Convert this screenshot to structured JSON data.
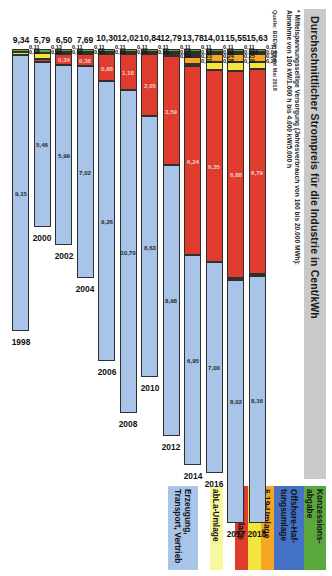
{
  "header": {
    "title": "Durchschnittlicher Strompreis für die Industrie in Cent/kWh",
    "footnote_line1": "* Mittelspannungsseitige Versorgung (Jahresverbrauch von 160 bis 20.000 MWh):",
    "footnote_line2": "Abnahme von 100 kW/1.600 h bis 4.000 kW/5.000 h",
    "source": "Quelle: BDEW, Stand Mai 2018"
  },
  "legend": {
    "items": [
      {
        "label": "Konzessions-abgabe",
        "color": "#5ba83f"
      },
      {
        "label": "Offshore-Haf-tungsumlage",
        "color": "#4472c4"
      },
      {
        "label": "§ 19-Umlage",
        "color": "#f5a623"
      },
      {
        "label": "KWKG",
        "color": "#f2e63d"
      },
      {
        "label": "EEG-Umlage",
        "color": "#e03c2d"
      },
      {
        "label": "abLa-Umlage",
        "color": "#f7f79e"
      },
      {
        "label": "Erzeugung, Transport, Vertrieb",
        "color": "#a8c4e8"
      }
    ]
  },
  "chart_data": {
    "type": "bar",
    "orientation": "horizontal-stacked",
    "title": "Durchschnittlicher Strompreis für die Industrie in Cent/kWh",
    "xlabel": "",
    "ylabel": "Cent/kWh",
    "xlim": [
      0,
      16
    ],
    "grid": false,
    "legend_position": "right",
    "categories": [
      "1998",
      "2000",
      "2002",
      "2004",
      "2006",
      "2008",
      "2010",
      "2012",
      "2014",
      "2016",
      "2017",
      "2018"
    ],
    "series": [
      {
        "name": "Konzessionsabgabe",
        "color": "#5ba83f",
        "values": [
          0.11,
          0.11,
          0.11,
          0.11,
          0.11,
          0.11,
          0.11,
          0.11,
          0.11,
          0.11,
          0.11,
          0.11
        ]
      },
      {
        "name": "Offshore-Haftungsumlage",
        "color": "#4472c4",
        "values": [
          null,
          null,
          null,
          null,
          null,
          null,
          null,
          null,
          0.07,
          0.03,
          0.006,
          0.04
        ]
      },
      {
        "name": "§ 19-Umlage",
        "color": "#f5a623",
        "values": [
          null,
          null,
          0.13,
          null,
          null,
          null,
          null,
          0.07,
          0.23,
          0.24,
          0.25,
          0.24
        ]
      },
      {
        "name": "KWKG",
        "color": "#f2e63d",
        "values": [
          0.08,
          0.08,
          0.2,
          0.05,
          0.05,
          0.05,
          0.05,
          0.04,
          0.17,
          0.28,
          0.29,
          0.26
        ]
      },
      {
        "name": "EEG-Umlage",
        "color": "#e03c2d",
        "values": [
          null,
          0.2,
          0.34,
          0.38,
          0.88,
          1.18,
          2.05,
          3.59,
          6.24,
          6.35,
          6.88,
          6.79
        ]
      },
      {
        "name": "Erzeugung, Transport, Vertrieb",
        "color": "#a8c4e8",
        "values": [
          9.15,
          5.46,
          5.99,
          7.02,
          9.26,
          10.7,
          8.63,
          8.98,
          6.95,
          7.0,
          8.02,
          8.16
        ]
      }
    ],
    "totals": [
      9.34,
      5.79,
      6.5,
      7.69,
      10.3,
      12.02,
      10.84,
      12.79,
      13.78,
      14.01,
      15.55,
      15.63
    ]
  },
  "rows": [
    {
      "year": "2018",
      "total": "15,63",
      "ticks": [
        "0,11",
        "0,04",
        "0,24",
        "0,26"
      ],
      "segs": [
        {
          "name": "konzessionsabgabe",
          "color": "#5ba83f",
          "w": 0.11,
          "label": ""
        },
        {
          "name": "offshore-haftungsumlage",
          "color": "#4472c4",
          "w": 0.04,
          "label": ""
        },
        {
          "name": "paragraph-19-umlage",
          "color": "#f5a623",
          "w": 0.24,
          "label": ""
        },
        {
          "name": "kwkg",
          "color": "#f2e63d",
          "w": 0.26,
          "label": ""
        },
        {
          "name": "eeg-umlage",
          "color": "#e03c2d",
          "w": 6.79,
          "label": "6,79"
        },
        {
          "name": "abla-umlage",
          "color": "#f7f79e",
          "w": 0.03,
          "label": ""
        },
        {
          "name": "erzeugung-transport-vertrieb",
          "color": "#a8c4e8",
          "w": 8.16,
          "label": "8,16"
        }
      ]
    },
    {
      "year": "2017",
      "total": "15,55",
      "ticks": [
        "0,11",
        "0,006",
        "0,25",
        "0,29"
      ],
      "segs": [
        {
          "name": "konzessionsabgabe",
          "color": "#5ba83f",
          "w": 0.11,
          "label": ""
        },
        {
          "name": "offshore-haftungsumlage",
          "color": "#4472c4",
          "w": 0.03,
          "label": ""
        },
        {
          "name": "paragraph-19-umlage",
          "color": "#f5a623",
          "w": 0.25,
          "label": ""
        },
        {
          "name": "kwkg",
          "color": "#f2e63d",
          "w": 0.29,
          "label": ""
        },
        {
          "name": "eeg-umlage",
          "color": "#e03c2d",
          "w": 6.88,
          "label": "6,88"
        },
        {
          "name": "abla-umlage",
          "color": "#f7f79e",
          "w": 0.03,
          "label": ""
        },
        {
          "name": "erzeugung-transport-vertrieb",
          "color": "#a8c4e8",
          "w": 8.02,
          "label": "8,02"
        }
      ]
    },
    {
      "year": "2016",
      "total": "14,01",
      "ticks": [
        "0,11",
        "0,03",
        "0,24",
        "0,28"
      ],
      "segs": [
        {
          "name": "konzessionsabgabe",
          "color": "#5ba83f",
          "w": 0.11,
          "label": ""
        },
        {
          "name": "offshore-haftungsumlage",
          "color": "#4472c4",
          "w": 0.03,
          "label": ""
        },
        {
          "name": "paragraph-19-umlage",
          "color": "#f5a623",
          "w": 0.24,
          "label": ""
        },
        {
          "name": "kwkg",
          "color": "#f2e63d",
          "w": 0.28,
          "label": ""
        },
        {
          "name": "eeg-umlage",
          "color": "#e03c2d",
          "w": 6.35,
          "label": "6,35"
        },
        {
          "name": "erzeugung-transport-vertrieb",
          "color": "#a8c4e8",
          "w": 7.0,
          "label": "7,00"
        }
      ]
    },
    {
      "year": "2014",
      "total": "13,78",
      "ticks": [
        "0,11",
        "0,17",
        "0,23",
        "0,07"
      ],
      "segs": [
        {
          "name": "konzessionsabgabe",
          "color": "#5ba83f",
          "w": 0.11,
          "label": ""
        },
        {
          "name": "offshore-haftungsumlage",
          "color": "#2f2f2f",
          "w": 0.17,
          "label": ""
        },
        {
          "name": "paragraph-19-umlage",
          "color": "#f5a623",
          "w": 0.23,
          "label": ""
        },
        {
          "name": "kwkg",
          "color": "#f2e63d",
          "w": 0.07,
          "label": ""
        },
        {
          "name": "eeg-umlage",
          "color": "#e03c2d",
          "w": 6.24,
          "label": "6,24"
        },
        {
          "name": "erzeugung-transport-vertrieb",
          "color": "#a8c4e8",
          "w": 6.95,
          "label": "6,95"
        }
      ]
    },
    {
      "year": "2012",
      "total": "12,79",
      "ticks": [
        "0,11",
        "0,07",
        "0,04"
      ],
      "segs": [
        {
          "name": "konzessionsabgabe",
          "color": "#5ba83f",
          "w": 0.11,
          "label": ""
        },
        {
          "name": "paragraph-19-umlage",
          "color": "#2f2f2f",
          "w": 0.07,
          "label": ""
        },
        {
          "name": "kwkg",
          "color": "#f2e63d",
          "w": 0.04,
          "label": ""
        },
        {
          "name": "eeg-umlage",
          "color": "#e03c2d",
          "w": 3.59,
          "label": "3,59"
        },
        {
          "name": "erzeugung-transport-vertrieb",
          "color": "#a8c4e8",
          "w": 8.98,
          "label": "8,98"
        }
      ]
    },
    {
      "year": "2010",
      "total": "10,84",
      "ticks": [
        "0,11",
        "0,05"
      ],
      "segs": [
        {
          "name": "konzessionsabgabe",
          "color": "#5ba83f",
          "w": 0.11,
          "label": ""
        },
        {
          "name": "kwkg",
          "color": "#f2e63d",
          "w": 0.05,
          "label": ""
        },
        {
          "name": "eeg-umlage",
          "color": "#e03c2d",
          "w": 2.05,
          "label": "2,05"
        },
        {
          "name": "erzeugung-transport-vertrieb",
          "color": "#a8c4e8",
          "w": 8.63,
          "label": "8,63"
        }
      ]
    },
    {
      "year": "2008",
      "total": "12,02",
      "ticks": [
        "0,11",
        "0,05"
      ],
      "segs": [
        {
          "name": "konzessionsabgabe",
          "color": "#5ba83f",
          "w": 0.11,
          "label": ""
        },
        {
          "name": "kwkg",
          "color": "#f2e63d",
          "w": 0.05,
          "label": ""
        },
        {
          "name": "eeg-umlage",
          "color": "#e03c2d",
          "w": 1.18,
          "label": "1,18"
        },
        {
          "name": "erzeugung-transport-vertrieb",
          "color": "#a8c4e8",
          "w": 10.7,
          "label": "10,70"
        }
      ]
    },
    {
      "year": "2006",
      "total": "10,30",
      "ticks": [
        "0,11",
        "0,05"
      ],
      "segs": [
        {
          "name": "konzessionsabgabe",
          "color": "#5ba83f",
          "w": 0.11,
          "label": ""
        },
        {
          "name": "kwkg",
          "color": "#f2e63d",
          "w": 0.05,
          "label": ""
        },
        {
          "name": "eeg-umlage",
          "color": "#e03c2d",
          "w": 0.88,
          "label": "0,88"
        },
        {
          "name": "erzeugung-transport-vertrieb",
          "color": "#a8c4e8",
          "w": 9.26,
          "label": "9,26"
        }
      ]
    },
    {
      "year": "2004",
      "total": "7,69",
      "ticks": [
        "0,11",
        "0,05"
      ],
      "segs": [
        {
          "name": "konzessionsabgabe",
          "color": "#5ba83f",
          "w": 0.11,
          "label": ""
        },
        {
          "name": "kwkg",
          "color": "#f2e63d",
          "w": 0.05,
          "label": ""
        },
        {
          "name": "eeg-umlage",
          "color": "#e03c2d",
          "w": 0.38,
          "label": "0,38"
        },
        {
          "name": "erzeugung-transport-vertrieb",
          "color": "#a8c4e8",
          "w": 7.02,
          "label": "7,02"
        }
      ]
    },
    {
      "year": "2002",
      "total": "6,50",
      "ticks": [
        "0,11",
        "0,05"
      ],
      "segs": [
        {
          "name": "konzessionsabgabe",
          "color": "#5ba83f",
          "w": 0.11,
          "label": ""
        },
        {
          "name": "kwkg",
          "color": "#f2e63d",
          "w": 0.05,
          "label": ""
        },
        {
          "name": "eeg-umlage",
          "color": "#e03c2d",
          "w": 0.34,
          "label": "0,34"
        },
        {
          "name": "erzeugung-transport-vertrieb",
          "color": "#a8c4e8",
          "w": 5.99,
          "label": "5,99"
        }
      ]
    },
    {
      "year": "2000",
      "total": "5,79",
      "ticks": [
        "0,13",
        "0,20"
      ],
      "segs": [
        {
          "name": "konzessionsabgabe",
          "color": "#5ba83f",
          "w": 0.13,
          "label": ""
        },
        {
          "name": "kwkg",
          "color": "#f2e63d",
          "w": 0.2,
          "label": ""
        },
        {
          "name": "eeg-umlage",
          "color": "#e03c2d",
          "w": 0.1,
          "label": ""
        },
        {
          "name": "erzeugung-transport-vertrieb",
          "color": "#a8c4e8",
          "w": 5.46,
          "label": "5,46"
        }
      ]
    },
    {
      "year": "1998",
      "total": "9,34",
      "ticks": [
        "0,11",
        "0,08"
      ],
      "segs": [
        {
          "name": "konzessionsabgabe",
          "color": "#5ba83f",
          "w": 0.11,
          "label": ""
        },
        {
          "name": "kwkg",
          "color": "#f2e63d",
          "w": 0.08,
          "label": ""
        },
        {
          "name": "erzeugung-transport-vertrieb",
          "color": "#a8c4e8",
          "w": 9.15,
          "label": "9,15"
        }
      ]
    }
  ]
}
